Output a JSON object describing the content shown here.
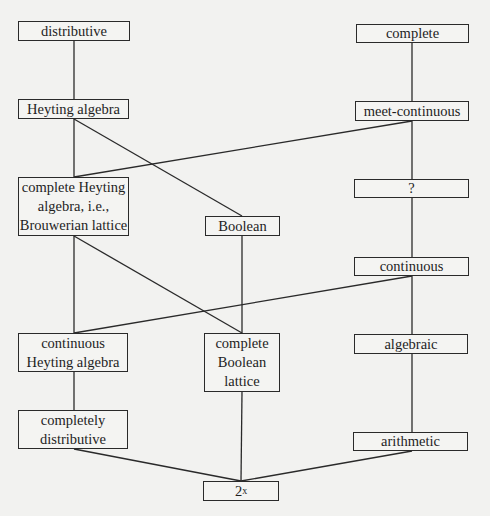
{
  "diagram": {
    "type": "hasse-diagram",
    "nodes": [
      {
        "id": "distributive",
        "label": "distributive",
        "x": 18,
        "y": 21,
        "w": 112,
        "h": 20
      },
      {
        "id": "complete",
        "label": "complete",
        "x": 356,
        "y": 24,
        "w": 113,
        "h": 19
      },
      {
        "id": "heyting",
        "label": "Heyting algebra",
        "x": 18,
        "y": 99,
        "w": 111,
        "h": 20
      },
      {
        "id": "meet_continuous",
        "label": "meet-continuous",
        "x": 355,
        "y": 101,
        "w": 114,
        "h": 20
      },
      {
        "id": "complete_heyting",
        "label": "complete Heyting\nalgebra, i.e.,\nBrouwerian lattice",
        "x": 18,
        "y": 177,
        "w": 111,
        "h": 59
      },
      {
        "id": "question",
        "label": "?",
        "x": 354,
        "y": 179,
        "w": 115,
        "h": 19
      },
      {
        "id": "boolean",
        "label": "Boolean",
        "x": 205,
        "y": 216,
        "w": 75,
        "h": 20
      },
      {
        "id": "continuous",
        "label": "continuous",
        "x": 354,
        "y": 257,
        "w": 115,
        "h": 19
      },
      {
        "id": "continuous_heyting",
        "label": "continuous\nHeyting algebra",
        "x": 18,
        "y": 333,
        "w": 110,
        "h": 39
      },
      {
        "id": "complete_boolean",
        "label": "complete\nBoolean\nlattice",
        "x": 204,
        "y": 333,
        "w": 76,
        "h": 59
      },
      {
        "id": "algebraic",
        "label": "algebraic",
        "x": 354,
        "y": 334,
        "w": 114,
        "h": 20
      },
      {
        "id": "completely_distributive",
        "label": "completely\ndistributive",
        "x": 18,
        "y": 410,
        "w": 110,
        "h": 39
      },
      {
        "id": "arithmetic",
        "label": "arithmetic",
        "x": 353,
        "y": 432,
        "w": 115,
        "h": 19
      },
      {
        "id": "power_set",
        "label": "2",
        "sup": "x",
        "x": 203,
        "y": 481,
        "w": 76,
        "h": 20
      }
    ],
    "edges": [
      {
        "from": "distributive",
        "to": "heyting",
        "x1": 74,
        "y1": 41,
        "x2": 74,
        "y2": 99
      },
      {
        "from": "complete",
        "to": "meet_continuous",
        "x1": 412,
        "y1": 43,
        "x2": 412,
        "y2": 101
      },
      {
        "from": "heyting",
        "to": "complete_heyting",
        "x1": 74,
        "y1": 119,
        "x2": 74,
        "y2": 177
      },
      {
        "from": "heyting",
        "to": "boolean",
        "x1": 74,
        "y1": 119,
        "x2": 242,
        "y2": 216
      },
      {
        "from": "meet_continuous",
        "to": "complete_heyting",
        "x1": 412,
        "y1": 121,
        "x2": 74,
        "y2": 177
      },
      {
        "from": "meet_continuous",
        "to": "question",
        "x1": 412,
        "y1": 121,
        "x2": 412,
        "y2": 179
      },
      {
        "from": "question",
        "to": "continuous",
        "x1": 412,
        "y1": 198,
        "x2": 412,
        "y2": 257
      },
      {
        "from": "complete_heyting",
        "to": "continuous_heyting",
        "x1": 74,
        "y1": 236,
        "x2": 74,
        "y2": 333
      },
      {
        "from": "complete_heyting",
        "to": "complete_boolean",
        "x1": 74,
        "y1": 236,
        "x2": 242,
        "y2": 333
      },
      {
        "from": "boolean",
        "to": "complete_boolean",
        "x1": 242,
        "y1": 236,
        "x2": 242,
        "y2": 333
      },
      {
        "from": "continuous",
        "to": "continuous_heyting",
        "x1": 412,
        "y1": 276,
        "x2": 74,
        "y2": 333
      },
      {
        "from": "continuous",
        "to": "algebraic",
        "x1": 412,
        "y1": 276,
        "x2": 412,
        "y2": 334
      },
      {
        "from": "continuous_heyting",
        "to": "completely_distributive",
        "x1": 74,
        "y1": 372,
        "x2": 74,
        "y2": 410
      },
      {
        "from": "algebraic",
        "to": "arithmetic",
        "x1": 412,
        "y1": 354,
        "x2": 412,
        "y2": 432
      },
      {
        "from": "completely_distributive",
        "to": "power_set",
        "x1": 74,
        "y1": 449,
        "x2": 241,
        "y2": 481
      },
      {
        "from": "complete_boolean",
        "to": "power_set",
        "x1": 242,
        "y1": 392,
        "x2": 241,
        "y2": 481
      },
      {
        "from": "arithmetic",
        "to": "power_set",
        "x1": 412,
        "y1": 451,
        "x2": 241,
        "y2": 481
      }
    ]
  }
}
